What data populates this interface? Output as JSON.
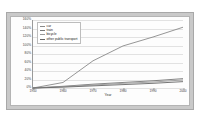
{
  "chart_data": {
    "type": "line",
    "title": "",
    "xlabel": "Year",
    "ylabel": "",
    "x": [
      1950,
      1960,
      1970,
      1980,
      1990,
      2000
    ],
    "xlim": [
      1950,
      2000
    ],
    "ylim": [
      0,
      160
    ],
    "grid": true,
    "legend_position": "top-left",
    "ytick_labels": [
      "160%",
      "140%",
      "120%",
      "100%",
      "80%",
      "60%",
      "40%",
      "20%",
      "0%"
    ],
    "ytick_values": [
      160,
      140,
      120,
      100,
      80,
      60,
      40,
      20,
      0
    ],
    "xtick_labels": [
      "1950",
      "1960",
      "1970",
      "1980",
      "1990",
      "2000"
    ],
    "series": [
      {
        "name": "car",
        "color": "#8a8a8a",
        "values": [
          0,
          13,
          64,
          99,
          120,
          143
        ]
      },
      {
        "name": "train",
        "color": "#777777",
        "values": [
          0,
          4,
          9,
          13,
          17,
          22
        ]
      },
      {
        "name": "bicycle",
        "color": "#9c9c9c",
        "values": [
          0,
          3,
          7,
          11,
          14,
          19
        ]
      },
      {
        "name": "other public transport",
        "color": "#666666",
        "values": [
          0,
          2,
          5,
          8,
          11,
          15
        ]
      }
    ]
  },
  "legend": {
    "items": [
      {
        "label": "car"
      },
      {
        "label": "train"
      },
      {
        "label": "bicycle"
      },
      {
        "label": "other public transport"
      }
    ]
  }
}
